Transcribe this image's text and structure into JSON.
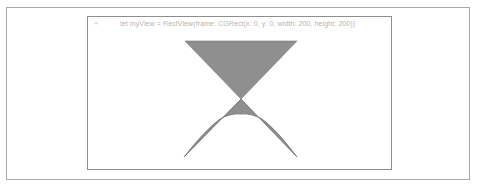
{
  "playground": {
    "gutter_marker": "+",
    "code_line": "let myView = RectView(frame: CGRect(x: 0, y: 0, width: 200, height: 200))"
  },
  "drawing": {
    "fill_color": "#8f8f8f",
    "stroke_color": "#6d6d6d",
    "top_triangle": {
      "left": [
        97,
        24
      ],
      "right": [
        209,
        24
      ],
      "apex": [
        153,
        82
      ]
    },
    "lower_shape": {
      "apex": [
        153,
        82
      ],
      "left": [
        96,
        140
      ],
      "right": [
        209,
        140
      ],
      "curve_peak_y": 97
    }
  }
}
